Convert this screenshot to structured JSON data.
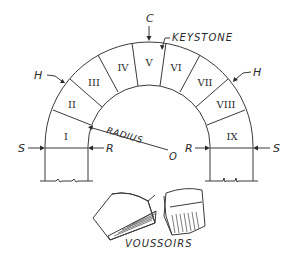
{
  "diagram": {
    "title": "VOUSSOIRS",
    "labels": {
      "crown": "C",
      "keystone": "KEYSTONE",
      "haunch_left": "H",
      "haunch_right": "H",
      "springing_left": "S",
      "springing_right": "S",
      "rise_left": "R",
      "rise_right": "R",
      "radius": "RADIUS",
      "center": "O"
    },
    "voussoirs": [
      "I",
      "II",
      "III",
      "IV",
      "V",
      "VI",
      "VII",
      "VIII",
      "IX"
    ],
    "voussoir_blocks_caption": "VOUSSOIRS"
  }
}
